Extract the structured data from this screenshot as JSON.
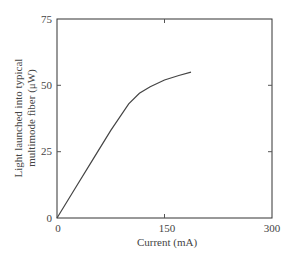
{
  "chart_data": {
    "type": "line",
    "title": "",
    "xlabel": "Current (mA)",
    "ylabel_line1": "Light launched into typical",
    "ylabel_line2": "multimode fiber (μW)",
    "xlim": [
      0,
      300
    ],
    "ylim": [
      0,
      75
    ],
    "xticks": [
      "0",
      "150",
      "300"
    ],
    "yticks": [
      "0",
      "25",
      "50",
      "75"
    ],
    "grid": false,
    "series": [
      {
        "name": "LED output",
        "x": [
          0,
          25,
          50,
          75,
          100,
          115,
          130,
          150,
          170,
          187
        ],
        "y": [
          0,
          11,
          22,
          33,
          43,
          47,
          49.5,
          52,
          53.7,
          55
        ]
      }
    ]
  },
  "colors": {
    "axis": "#333333",
    "line": "#444444",
    "text": "#444444"
  }
}
